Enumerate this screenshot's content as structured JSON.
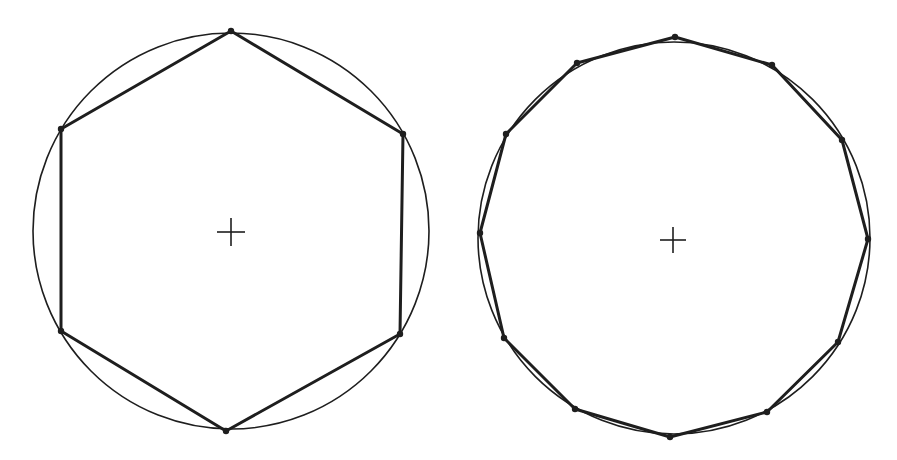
{
  "diagram": {
    "width": 897,
    "height": 460,
    "background": "#ffffff",
    "stroke_color": "#1e1e1e",
    "figures": [
      {
        "name": "hexagon-figure",
        "sides": 6,
        "circle": {
          "cx": 231,
          "cy": 231,
          "r": 198,
          "stroke_width": 1.6
        },
        "center_mark": {
          "x": 231,
          "y": 232,
          "size": 14
        },
        "polygon_stroke_width": 3,
        "vertex_radius": 3.2,
        "vertices": [
          [
            231,
            31
          ],
          [
            403,
            134
          ],
          [
            400,
            334
          ],
          [
            226,
            431
          ],
          [
            61,
            331
          ],
          [
            61,
            129
          ]
        ]
      },
      {
        "name": "dodecagon-figure",
        "sides": 12,
        "circle": {
          "cx": 674,
          "cy": 238,
          "r": 196,
          "stroke_width": 1.6
        },
        "center_mark": {
          "x": 673,
          "y": 240,
          "size": 13
        },
        "polygon_stroke_width": 3,
        "vertex_radius": 3.2,
        "vertices": [
          [
            675,
            37
          ],
          [
            772,
            65
          ],
          [
            842,
            140
          ],
          [
            868,
            239
          ],
          [
            838,
            342
          ],
          [
            767,
            412
          ],
          [
            670,
            437
          ],
          [
            575,
            409
          ],
          [
            504,
            338
          ],
          [
            480,
            233
          ],
          [
            506,
            134
          ],
          [
            577,
            63
          ]
        ]
      }
    ]
  }
}
